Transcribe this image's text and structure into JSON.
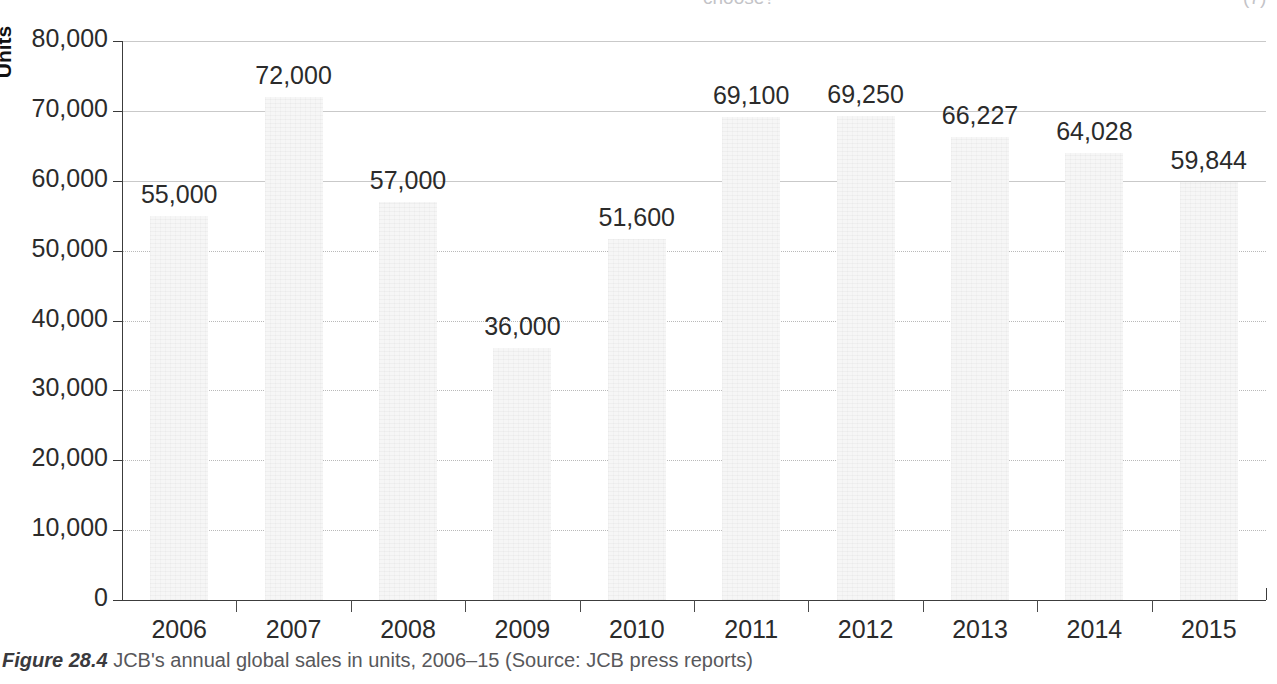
{
  "page_bleed": {
    "question_fragment": "choose?",
    "marks_fragment": "(7)"
  },
  "figure": {
    "number_label": "Figure 28.4",
    "caption_text": "JCB's annual global sales in units, 2006–15 (Source: JCB press reports)"
  },
  "colors": {
    "bar_fill": "#f6f6f6",
    "gridline": "#b9b9b9",
    "axis": "#3c3c3c",
    "text": "#2b2b2b",
    "caption_text": "#58585b",
    "background": "#ffffff"
  },
  "chart_data": {
    "type": "bar",
    "title": "",
    "subtitle": "",
    "xlabel": "",
    "ylabel": "Units",
    "categories": [
      "2006",
      "2007",
      "2008",
      "2009",
      "2010",
      "2011",
      "2012",
      "2013",
      "2014",
      "2015"
    ],
    "values": [
      55000,
      72000,
      57000,
      36000,
      51600,
      69100,
      69250,
      66227,
      64028,
      59844
    ],
    "value_labels": [
      "55,000",
      "72,000",
      "57,000",
      "36,000",
      "51,600",
      "69,100",
      "69,250",
      "66,227",
      "64,028",
      "59,844"
    ],
    "ylim": [
      0,
      80000
    ],
    "y_ticks": [
      0,
      10000,
      20000,
      30000,
      40000,
      50000,
      60000,
      70000,
      80000
    ],
    "y_tick_labels": [
      "0",
      "10,000",
      "20,000",
      "30,000",
      "40,000",
      "50,000",
      "60,000",
      "70,000",
      "80,000"
    ],
    "grid": true,
    "grid_axis": "y",
    "legend": false,
    "legend_position": "none",
    "series": [
      {
        "name": "JCB global sales (units)",
        "values": [
          55000,
          72000,
          57000,
          36000,
          51600,
          69100,
          69250,
          66227,
          64028,
          59844
        ]
      }
    ]
  }
}
